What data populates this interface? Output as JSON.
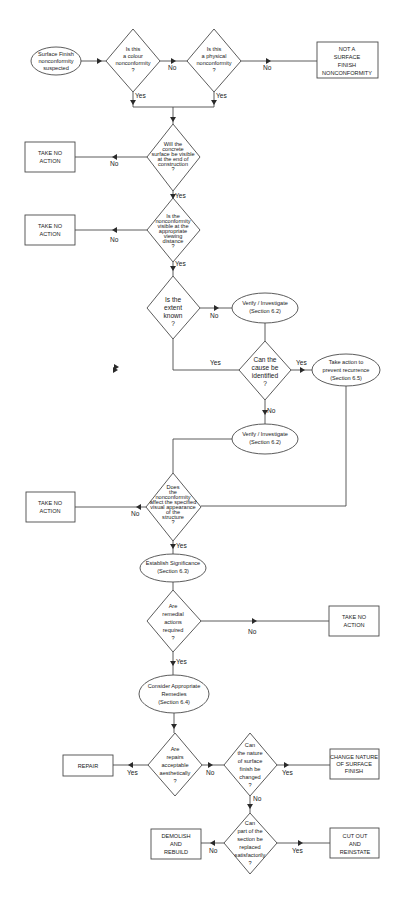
{
  "flowchart": {
    "start": {
      "lines": [
        "Surface Finish",
        "nonconformity",
        "suspected"
      ]
    },
    "q_colour": {
      "lines": [
        "Is this",
        "a colour",
        "nonconformity",
        "?"
      ]
    },
    "q_physical": {
      "lines": [
        "Is this",
        "a physical",
        "nonconformity",
        "?"
      ]
    },
    "not_surface": {
      "lines": [
        "NOT A",
        "SURFACE",
        "FINISH",
        "NONCONFORMITY"
      ]
    },
    "q_visible_end": {
      "lines": [
        "Will the",
        "concrete",
        "surface be visible",
        "at the end of",
        "construction",
        "?"
      ]
    },
    "take_no_action_1": {
      "lines": [
        "TAKE NO",
        "ACTION"
      ]
    },
    "q_visible_distance": {
      "lines": [
        "Is the",
        "nonconformity",
        "visible at the",
        "appropriate",
        "viewing",
        "distance",
        "?"
      ]
    },
    "take_no_action_2": {
      "lines": [
        "TAKE NO",
        "ACTION"
      ]
    },
    "q_extent": {
      "lines": [
        "Is the",
        "extent",
        "known",
        "?"
      ]
    },
    "verify_1": {
      "lines": [
        "Verify / Investigate",
        "(Section 6.2)"
      ]
    },
    "q_cause": {
      "lines": [
        "Can the",
        "cause be",
        "identified",
        "?"
      ]
    },
    "prevent": {
      "lines": [
        "Take action to",
        "prevent recurrence",
        "(Section 6.5)"
      ]
    },
    "verify_2": {
      "lines": [
        "Verify / Investigate",
        "(Section 6.2)"
      ]
    },
    "q_affect": {
      "lines": [
        "Does",
        "the",
        "nonconformity",
        "affect the specified",
        "visual appearance",
        "of the",
        "structure",
        "?"
      ]
    },
    "take_no_action_3": {
      "lines": [
        "TAKE NO",
        "ACTION"
      ]
    },
    "significance": {
      "lines": [
        "Establish Significance",
        "(Section 6.3)"
      ]
    },
    "q_remedial": {
      "lines": [
        "Are",
        "remedial",
        "actions",
        "required",
        "?"
      ]
    },
    "take_no_action_4": {
      "lines": [
        "TAKE NO",
        "ACTION"
      ]
    },
    "remedies": {
      "lines": [
        "Consider Appropriate",
        "Remedies",
        "(Section 6.4)"
      ]
    },
    "q_repairs": {
      "lines": [
        "Are",
        "repairs",
        "acceptable",
        "aesthetically",
        "?"
      ]
    },
    "repair": {
      "lines": [
        "REPAIR"
      ]
    },
    "q_nature": {
      "lines": [
        "Can",
        "the nature",
        "of surface",
        "finish be",
        "changed",
        "?"
      ]
    },
    "change_nature": {
      "lines": [
        "CHANGE NATURE",
        "OF SURFACE",
        "FINISH"
      ]
    },
    "q_replace": {
      "lines": [
        "Can",
        "part of the",
        "section be",
        "replaced",
        "satisfactorily",
        "?"
      ]
    },
    "demolish": {
      "lines": [
        "DEMOLISH",
        "AND",
        "REBUILD"
      ]
    },
    "cut_out": {
      "lines": [
        "CUT OUT",
        "AND",
        "REINSTATE"
      ]
    }
  },
  "labels": {
    "yes": "Yes",
    "no": "No"
  },
  "colors": {
    "stroke": "#4a4a4a",
    "text": "#1a1a1a",
    "background": "#ffffff"
  }
}
